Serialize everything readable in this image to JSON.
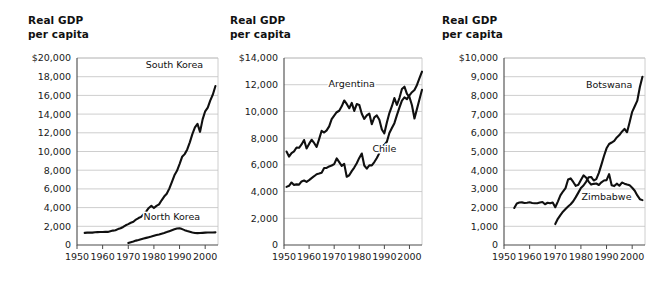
{
  "figure": {
    "title_text": "Real GDP\nper capita",
    "line_color": "#101010",
    "grid_color": "#b9b9b9",
    "axis_color": "#4a4a4a"
  },
  "chart_data": [
    {
      "type": "line",
      "title": "Real GDP per capita",
      "xlabel": "",
      "ylabel": "Real GDP per capita",
      "xlim": [
        1950,
        2005
      ],
      "ylim": [
        0,
        20000
      ],
      "grid": true,
      "legend_position": "inline-annotation",
      "ytick_labels": [
        "$20,000",
        "18,000",
        "16,000",
        "14,000",
        "12,000",
        "10,000",
        "8,000",
        "6,000",
        "4,000",
        "2,000",
        "0"
      ],
      "ytick_values": [
        20000,
        18000,
        16000,
        14000,
        12000,
        10000,
        8000,
        6000,
        4000,
        2000,
        0
      ],
      "xtick_labels": [
        "1950",
        "1960",
        "1970",
        "1980",
        "1990",
        "2000"
      ],
      "xtick_values": [
        1950,
        1960,
        1970,
        1980,
        1990,
        2000
      ],
      "series": [
        {
          "name": "South Korea",
          "label_x": 1988,
          "label_y": 18900,
          "x": [
            1953,
            1954,
            1955,
            1956,
            1957,
            1958,
            1959,
            1960,
            1961,
            1962,
            1963,
            1964,
            1965,
            1966,
            1967,
            1968,
            1969,
            1970,
            1971,
            1972,
            1973,
            1974,
            1975,
            1976,
            1977,
            1978,
            1979,
            1980,
            1981,
            1982,
            1983,
            1984,
            1985,
            1986,
            1987,
            1988,
            1989,
            1990,
            1991,
            1992,
            1993,
            1994,
            1995,
            1996,
            1997,
            1998,
            1999,
            2000,
            2001,
            2002,
            2003,
            2004
          ],
          "values": [
            1300,
            1320,
            1330,
            1320,
            1360,
            1380,
            1390,
            1390,
            1400,
            1400,
            1470,
            1540,
            1580,
            1700,
            1790,
            1930,
            2110,
            2230,
            2380,
            2480,
            2720,
            2880,
            3010,
            3300,
            3600,
            3960,
            4180,
            3950,
            4180,
            4350,
            4780,
            5180,
            5480,
            6030,
            6720,
            7450,
            7930,
            8650,
            9430,
            9720,
            10220,
            10980,
            11860,
            12570,
            12950,
            12100,
            13440,
            14300,
            14700,
            15470,
            16100,
            17000
          ],
          "style": "solid"
        },
        {
          "name": "North Korea",
          "label_x": 1987,
          "label_y": 2700,
          "x": [
            1970,
            1971,
            1972,
            1973,
            1974,
            1975,
            1976,
            1977,
            1978,
            1979,
            1980,
            1981,
            1982,
            1983,
            1984,
            1985,
            1986,
            1987,
            1988,
            1989,
            1990,
            1991,
            1992,
            1993,
            1994,
            1995,
            1996,
            1997,
            1998,
            1999,
            2000,
            2001,
            2002,
            2003,
            2004
          ],
          "values": [
            210,
            300,
            380,
            470,
            540,
            620,
            690,
            760,
            830,
            900,
            980,
            1060,
            1130,
            1210,
            1290,
            1380,
            1480,
            1580,
            1680,
            1760,
            1790,
            1700,
            1590,
            1500,
            1420,
            1340,
            1290,
            1270,
            1280,
            1300,
            1320,
            1330,
            1340,
            1340,
            1350
          ],
          "style": "solid"
        }
      ]
    },
    {
      "type": "line",
      "title": "Real GDP per capita",
      "xlabel": "",
      "ylabel": "Real GDP per capita",
      "xlim": [
        1950,
        2005
      ],
      "ylim": [
        0,
        14000
      ],
      "grid": true,
      "legend_position": "inline-annotation",
      "ytick_labels": [
        "$14,000",
        "12,000",
        "10,000",
        "8,000",
        "6,000",
        "4,000",
        "2,000",
        "0"
      ],
      "ytick_values": [
        14000,
        12000,
        10000,
        8000,
        6000,
        4000,
        2000,
        0
      ],
      "xtick_labels": [
        "1950",
        "1960",
        "1970",
        "1980",
        "1990",
        "2000"
      ],
      "xtick_values": [
        1950,
        1960,
        1970,
        1980,
        1990,
        2000
      ],
      "series": [
        {
          "name": "Argentina",
          "label_x": 1977,
          "label_y": 11800,
          "x": [
            1951,
            1952,
            1953,
            1954,
            1955,
            1956,
            1957,
            1958,
            1959,
            1960,
            1961,
            1962,
            1963,
            1964,
            1965,
            1966,
            1967,
            1968,
            1969,
            1970,
            1971,
            1972,
            1973,
            1974,
            1975,
            1976,
            1977,
            1978,
            1979,
            1980,
            1981,
            1982,
            1983,
            1984,
            1985,
            1986,
            1987,
            1988,
            1989,
            1990,
            1991,
            1992,
            1993,
            1994,
            1995,
            1996,
            1997,
            1998,
            1999,
            2000,
            2001,
            2002,
            2003,
            2004,
            2005
          ],
          "values": [
            7000,
            6620,
            6880,
            7010,
            7300,
            7280,
            7530,
            7860,
            7230,
            7570,
            7880,
            7640,
            7350,
            7930,
            8550,
            8420,
            8580,
            8880,
            9420,
            9690,
            9940,
            10050,
            10380,
            10820,
            10560,
            10240,
            10640,
            10040,
            10550,
            10490,
            9820,
            9440,
            9700,
            9840,
            9040,
            9560,
            9700,
            9370,
            8650,
            8360,
            9170,
            9880,
            10390,
            11000,
            10490,
            11000,
            11680,
            11850,
            11310,
            11080,
            10460,
            9470,
            10190,
            10910,
            11620
          ],
          "style": "solid"
        },
        {
          "name": "Chile",
          "label_x": 1990,
          "label_y": 7000,
          "x": [
            1951,
            1952,
            1953,
            1954,
            1955,
            1956,
            1957,
            1958,
            1959,
            1960,
            1961,
            1962,
            1963,
            1964,
            1965,
            1966,
            1967,
            1968,
            1969,
            1970,
            1971,
            1972,
            1973,
            1974,
            1975,
            1976,
            1977,
            1978,
            1979,
            1980,
            1981,
            1982,
            1983,
            1984,
            1985,
            1986,
            1987,
            1988,
            1989,
            1990,
            1991,
            1992,
            1993,
            1994,
            1995,
            1996,
            1997,
            1998,
            1999,
            2000,
            2001,
            2002,
            2003,
            2004,
            2005
          ],
          "values": [
            4350,
            4430,
            4680,
            4500,
            4540,
            4520,
            4760,
            4830,
            4720,
            4860,
            5010,
            5150,
            5300,
            5350,
            5410,
            5760,
            5770,
            5880,
            5950,
            6060,
            6480,
            6200,
            5920,
            6070,
            5110,
            5220,
            5530,
            5800,
            6120,
            6520,
            6850,
            5950,
            5720,
            5970,
            5960,
            6210,
            6510,
            6880,
            7350,
            7500,
            7730,
            8380,
            8760,
            9120,
            9720,
            10280,
            10810,
            11050,
            10920,
            11200,
            11440,
            11610,
            11980,
            12490,
            12980
          ],
          "style": "solid"
        }
      ]
    },
    {
      "type": "line",
      "title": "Real GDP per capita",
      "xlabel": "",
      "ylabel": "Real GDP per capita",
      "xlim": [
        1950,
        2005
      ],
      "ylim": [
        0,
        10000
      ],
      "grid": true,
      "legend_position": "inline-annotation",
      "ytick_labels": [
        "$10,000",
        "9,000",
        "8,000",
        "7,000",
        "6,000",
        "5,000",
        "4,000",
        "3,000",
        "2,000",
        "1,000",
        "0"
      ],
      "ytick_values": [
        10000,
        9000,
        8000,
        7000,
        6000,
        5000,
        4000,
        3000,
        2000,
        1000,
        0
      ],
      "xtick_labels": [
        "1950",
        "1960",
        "1970",
        "1980",
        "1990",
        "2000"
      ],
      "xtick_values": [
        1950,
        1960,
        1970,
        1980,
        1990,
        2000
      ],
      "series": [
        {
          "name": "Botswana",
          "label_x": 1991,
          "label_y": 8400,
          "x": [
            1970,
            1971,
            1972,
            1973,
            1974,
            1975,
            1976,
            1977,
            1978,
            1979,
            1980,
            1981,
            1982,
            1983,
            1984,
            1985,
            1986,
            1987,
            1988,
            1989,
            1990,
            1991,
            1992,
            1993,
            1994,
            1995,
            1996,
            1997,
            1998,
            1999,
            2000,
            2001,
            2002,
            2003,
            2004
          ],
          "values": [
            1120,
            1400,
            1600,
            1780,
            1920,
            2060,
            2180,
            2340,
            2560,
            2800,
            3050,
            3180,
            3380,
            3620,
            3640,
            3450,
            3520,
            3860,
            4300,
            4760,
            5170,
            5400,
            5480,
            5570,
            5750,
            5880,
            6060,
            6210,
            6030,
            6560,
            7120,
            7420,
            7720,
            8450,
            9000
          ],
          "style": "solid"
        },
        {
          "name": "Zimbabwe",
          "label_x": 1990,
          "label_y": 2400,
          "x": [
            1954,
            1955,
            1956,
            1957,
            1958,
            1959,
            1960,
            1961,
            1962,
            1963,
            1964,
            1965,
            1966,
            1967,
            1968,
            1969,
            1970,
            1971,
            1972,
            1973,
            1974,
            1975,
            1976,
            1977,
            1978,
            1979,
            1980,
            1981,
            1982,
            1983,
            1984,
            1985,
            1986,
            1987,
            1988,
            1989,
            1990,
            1991,
            1992,
            1993,
            1994,
            1995,
            1996,
            1997,
            1998,
            1999,
            2000,
            2001,
            2002,
            2003,
            2004
          ],
          "values": [
            1980,
            2220,
            2270,
            2280,
            2250,
            2260,
            2290,
            2250,
            2230,
            2230,
            2270,
            2300,
            2180,
            2260,
            2230,
            2270,
            2020,
            2320,
            2650,
            2860,
            3040,
            3500,
            3560,
            3370,
            3160,
            3220,
            3480,
            3720,
            3610,
            3390,
            3230,
            3270,
            3290,
            3210,
            3350,
            3450,
            3470,
            3790,
            3200,
            3150,
            3280,
            3170,
            3340,
            3280,
            3230,
            3190,
            3060,
            2900,
            2650,
            2450,
            2400
          ],
          "style": "solid"
        }
      ]
    }
  ]
}
